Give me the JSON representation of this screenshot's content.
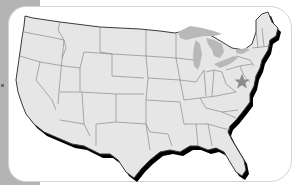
{
  "map": {
    "subject": "United States (contiguous 48 states)",
    "style": "state outline map with drop shadow",
    "colors": {
      "land_fill": "#e6e6e6",
      "state_border": "#8a8a8a",
      "coast_outline": "#3a3a3a",
      "shadow": "#000000",
      "lakes": "#b8b8b8",
      "marker": "#8c8c8c",
      "frame_band": "#b4b4b4",
      "card_border": "#d4d4d4"
    },
    "marker": {
      "icon": "star-icon",
      "location": "Virginia / Washington DC area"
    }
  }
}
